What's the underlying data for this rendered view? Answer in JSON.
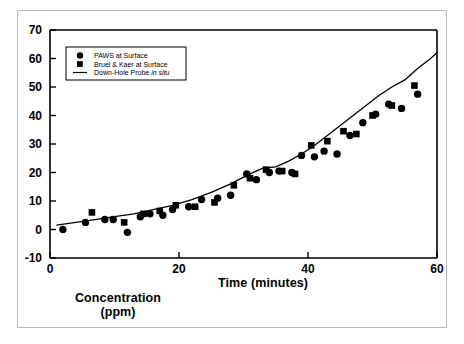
{
  "figure": {
    "border_color": "#b9b9b9",
    "background": "#ffffff",
    "ink_color": "#000000"
  },
  "axes": {
    "x_title": "Time (minutes)",
    "y_title_line1": "Concentration",
    "y_title_line2": "(ppm)",
    "x_ticks": [
      0,
      20,
      40,
      60
    ],
    "y_ticks": [
      -10,
      0,
      10,
      20,
      30,
      40,
      50,
      60,
      70
    ],
    "x_tick_labels": [
      "0",
      "20",
      "40",
      "60"
    ],
    "y_tick_labels": [
      "-10",
      "0",
      "10",
      "20",
      "30",
      "40",
      "50",
      "60",
      "70"
    ]
  },
  "legend": {
    "position": "top-left-inside",
    "entries": [
      {
        "label": "PAWS at Surface",
        "marker": "circle-marker",
        "italic_tail": ""
      },
      {
        "label": "Bruel & Kaer at Surface",
        "marker": "square-marker",
        "italic_tail": ""
      },
      {
        "label": "Down-Hole Probe ",
        "marker": "line-marker",
        "italic_tail": "in situ"
      }
    ]
  },
  "chart_data": {
    "type": "scatter",
    "title": "",
    "xlabel": "Time (minutes)",
    "ylabel": "Concentration (ppm)",
    "xlim": [
      0,
      60
    ],
    "ylim": [
      -10,
      70
    ],
    "xticks": [
      0,
      20,
      40,
      60
    ],
    "yticks": [
      -10,
      0,
      10,
      20,
      30,
      40,
      50,
      60,
      70
    ],
    "grid": false,
    "legend_position": "upper left",
    "series": [
      {
        "name": "PAWS at Surface",
        "marker": "circle",
        "color": "#000000",
        "x": [
          2.0,
          5.5,
          8.5,
          9.8,
          12.0,
          14.0,
          15.5,
          17.5,
          19.0,
          21.5,
          23.5,
          26.0,
          28.0,
          30.5,
          32.0,
          34.0,
          35.5,
          37.5,
          39.0,
          41.0,
          42.5,
          44.5,
          46.5,
          48.5,
          50.5,
          52.5,
          54.5,
          57.0
        ],
        "y": [
          0.0,
          2.5,
          3.5,
          3.5,
          -1.0,
          4.5,
          5.5,
          5.0,
          7.0,
          8.0,
          10.5,
          11.0,
          12.0,
          19.5,
          17.5,
          20.0,
          20.5,
          20.0,
          26.0,
          25.5,
          27.5,
          26.5,
          33.0,
          37.5,
          40.5,
          44.0,
          42.5,
          47.5
        ]
      },
      {
        "name": "Bruel & Kaer at Surface",
        "marker": "square",
        "color": "#000000",
        "x": [
          6.5,
          11.5,
          14.5,
          17.0,
          19.5,
          22.5,
          25.5,
          28.5,
          31.0,
          33.5,
          36.0,
          38.0,
          40.5,
          43.0,
          45.5,
          47.5,
          50.0,
          53.0,
          56.5
        ],
        "y": [
          6.0,
          2.5,
          5.5,
          6.5,
          8.5,
          8.0,
          9.5,
          15.5,
          18.0,
          21.0,
          20.5,
          19.5,
          29.5,
          31.0,
          34.5,
          33.5,
          40.0,
          43.5,
          50.5
        ]
      },
      {
        "name": "Down-Hole Probe in situ",
        "marker": "line",
        "color": "#000000",
        "x": [
          1.0,
          4.0,
          7.0,
          10.0,
          13.0,
          16.0,
          19.0,
          22.0,
          25.0,
          28.0,
          31.0,
          33.0,
          35.0,
          37.0,
          39.0,
          41.0,
          43.0,
          45.0,
          47.0,
          49.0,
          51.0,
          53.0,
          55.0,
          57.0,
          59.0,
          60.0
        ],
        "y": [
          1.5,
          2.5,
          3.5,
          4.5,
          5.5,
          7.0,
          8.5,
          10.5,
          13.0,
          16.0,
          19.5,
          21.5,
          22.0,
          24.0,
          26.5,
          29.5,
          33.0,
          36.5,
          40.0,
          43.5,
          47.0,
          50.0,
          52.5,
          56.5,
          60.0,
          62.0
        ]
      }
    ]
  }
}
